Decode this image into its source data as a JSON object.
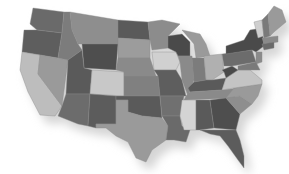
{
  "map": {
    "title": "United States map",
    "background": "#ffffff",
    "shadow_color": "#d4d4d4",
    "states": [
      {
        "id": "WA",
        "name": "Washington",
        "fill": "#6a6a6a",
        "points": "33,8 64,12 62,33 37,30 30,24"
      },
      {
        "id": "OR",
        "name": "Oregon",
        "fill": "#5e5e5e",
        "points": "24,30 37,30 62,33 58,58 22,52"
      },
      {
        "id": "CA",
        "name": "California",
        "fill": "#bdbdbd",
        "points": "22,52 40,55 38,74 62,106 55,116 40,115 28,92 20,70"
      },
      {
        "id": "NV",
        "name": "Nevada",
        "fill": "#9a9a9a",
        "points": "40,55 68,60 62,106 38,74"
      },
      {
        "id": "ID",
        "name": "Idaho",
        "fill": "#7c7c7c",
        "points": "64,12 70,12 72,30 78,44 82,50 68,60 58,58 62,33"
      },
      {
        "id": "MT",
        "name": "Montana",
        "fill": "#8e8e8e",
        "points": "70,12 118,20 118,44 82,44 78,44 72,30"
      },
      {
        "id": "WY",
        "name": "Wyoming",
        "fill": "#4e4e4e",
        "points": "82,44 118,44 116,70 84,68"
      },
      {
        "id": "UT",
        "name": "Utah",
        "fill": "#5a5a5a",
        "points": "68,60 82,50 84,68 92,70 90,94 66,94"
      },
      {
        "id": "AZ",
        "name": "Arizona",
        "fill": "#6c6c6c",
        "points": "66,94 90,94 88,126 78,124 58,116 62,106"
      },
      {
        "id": "CO",
        "name": "Colorado",
        "fill": "#c8c8c8",
        "points": "92,70 124,72 124,96 90,94"
      },
      {
        "id": "NM",
        "name": "New Mexico",
        "fill": "#5c5c5c",
        "points": "90,94 116,96 116,124 96,124 96,128 88,126"
      },
      {
        "id": "ND",
        "name": "North Dakota",
        "fill": "#5a5a5a",
        "points": "118,20 148,22 150,40 118,38"
      },
      {
        "id": "SD",
        "name": "South Dakota",
        "fill": "#9c9c9c",
        "points": "118,38 150,40 150,58 118,58"
      },
      {
        "id": "NE",
        "name": "Nebraska",
        "fill": "#8a8a8a",
        "points": "118,58 150,58 156,76 124,76 124,72 116,70"
      },
      {
        "id": "KS",
        "name": "Kansas",
        "fill": "#808080",
        "points": "124,76 158,76 160,96 124,96"
      },
      {
        "id": "OK",
        "name": "Oklahoma",
        "fill": "#5a5a5a",
        "points": "116,96 160,96 162,118 142,116 128,112 128,100 116,100"
      },
      {
        "id": "TX",
        "name": "Texas",
        "fill": "#9a9a9a",
        "points": "116,100 128,100 128,112 142,116 162,118 168,126 166,140 152,150 146,162 136,158 128,142 116,136 106,128 96,128 96,124 116,124"
      },
      {
        "id": "MN",
        "name": "Minnesota",
        "fill": "#8c8c8c",
        "points": "148,22 162,20 180,24 168,36 168,48 152,50 150,40"
      },
      {
        "id": "IA",
        "name": "Iowa",
        "fill": "#d0d0d0",
        "points": "152,52 176,52 180,62 176,70 154,70"
      },
      {
        "id": "MO",
        "name": "Missouri",
        "fill": "#5e5e5e",
        "points": "154,70 176,70 182,80 186,96 160,96 158,76"
      },
      {
        "id": "AR",
        "name": "Arkansas",
        "fill": "#707070",
        "points": "160,96 184,96 180,116 162,116"
      },
      {
        "id": "LA",
        "name": "Louisiana",
        "fill": "#6a6a6a",
        "points": "162,116 180,116 182,126 190,130 186,142 174,140 166,140 168,126"
      },
      {
        "id": "WI",
        "name": "Wisconsin",
        "fill": "#4a4a4a",
        "points": "168,36 182,34 190,42 190,56 178,56 176,52 168,48"
      },
      {
        "id": "IL",
        "name": "Illinois",
        "fill": "#8a8a8a",
        "points": "178,56 192,56 194,80 188,96 182,80 180,62"
      },
      {
        "id": "MI",
        "name": "Michigan",
        "fill": "#9a9a9a",
        "points": "182,30 200,34 206,44 210,56 196,58 194,44"
      },
      {
        "id": "IN",
        "name": "Indiana",
        "fill": "#7c7c7c",
        "points": "192,58 204,58 206,80 194,82"
      },
      {
        "id": "OH",
        "name": "Ohio",
        "fill": "#b0b0b0",
        "points": "204,56 222,54 224,72 212,80 206,80"
      },
      {
        "id": "KY",
        "name": "Kentucky",
        "fill": "#5a5a5a",
        "points": "188,88 194,82 206,80 212,80 226,78 222,90 190,92"
      },
      {
        "id": "TN",
        "name": "Tennessee",
        "fill": "#8a8a8a",
        "points": "186,96 190,92 222,90 240,88 234,98 184,100"
      },
      {
        "id": "MS",
        "name": "Mississippi",
        "fill": "#d4d4d4",
        "points": "182,100 196,100 196,130 184,130 180,116"
      },
      {
        "id": "AL",
        "name": "Alabama",
        "fill": "#5a5a5a",
        "points": "196,100 210,100 214,128 200,130 196,130"
      },
      {
        "id": "GA",
        "name": "Georgia",
        "fill": "#4e4e4e",
        "points": "210,100 226,98 240,114 236,130 214,128"
      },
      {
        "id": "FL",
        "name": "Florida",
        "fill": "#5c5c5c",
        "points": "200,130 236,130 240,140 244,156 244,168 238,160 228,146 220,136 210,134"
      },
      {
        "id": "SC",
        "name": "South Carolina",
        "fill": "#8e8e8e",
        "points": "226,98 240,96 252,104 240,114"
      },
      {
        "id": "NC",
        "name": "North Carolina",
        "fill": "#9a9a9a",
        "points": "234,88 262,84 258,96 252,104 240,96 226,98"
      },
      {
        "id": "VA",
        "name": "Virginia",
        "fill": "#c4c4c4",
        "points": "226,78 238,70 250,70 262,80 262,84 234,88 222,90"
      },
      {
        "id": "WV",
        "name": "West Virginia",
        "fill": "#4a4a4a",
        "points": "222,70 232,66 238,70 226,78 224,72"
      },
      {
        "id": "PA",
        "name": "Pennsylvania",
        "fill": "#6c6c6c",
        "points": "222,54 252,50 256,62 232,66 224,66"
      },
      {
        "id": "NY",
        "name": "New York",
        "fill": "#4a4a4a",
        "points": "226,46 244,40 250,30 262,28 264,46 256,52 252,50 226,54"
      },
      {
        "id": "VT",
        "name": "Vermont",
        "fill": "#cfcfcf",
        "points": "254,22 262,20 264,36 258,38"
      },
      {
        "id": "NH",
        "name": "New Hampshire",
        "fill": "#7a7a7a",
        "points": "262,20 268,14 270,36 264,38"
      },
      {
        "id": "ME",
        "name": "Maine",
        "fill": "#9a9a9a",
        "points": "268,14 274,6 282,10 286,22 274,32 270,36"
      },
      {
        "id": "MA",
        "name": "Massachusetts",
        "fill": "#8a8a8a",
        "points": "262,38 278,36 278,42 264,44"
      },
      {
        "id": "CT_RI",
        "name": "Connecticut / Rhode Island",
        "fill": "#6a6a6a",
        "points": "262,44 274,42 274,48 264,50"
      },
      {
        "id": "NJ",
        "name": "New Jersey",
        "fill": "#8a8a8a",
        "points": "256,52 262,52 262,62 256,64"
      },
      {
        "id": "MD_DE",
        "name": "Maryland / Delaware",
        "fill": "#7a7a7a",
        "points": "238,66 256,62 260,70 250,70 238,70"
      }
    ]
  }
}
